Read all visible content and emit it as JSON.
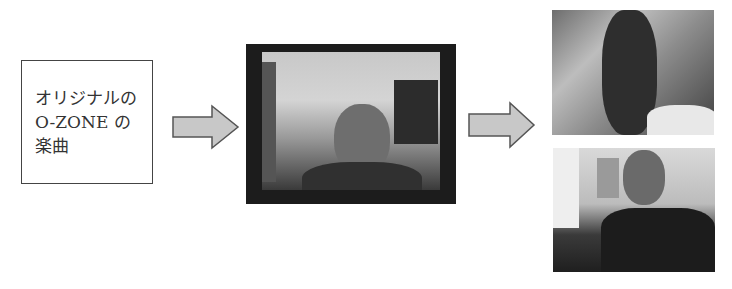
{
  "diagram": {
    "source_box": {
      "lines": [
        "オリジナルの",
        "O-ZONE の",
        "楽曲"
      ]
    },
    "arrows": [
      {
        "from": "source_box",
        "to": "center_image",
        "fill": "#c8c8c8"
      },
      {
        "from": "center_image",
        "to": "output_images",
        "fill": "#c8c8c8"
      }
    ],
    "center_image": {
      "description": "webcam video frame of a man with glasses lip-syncing",
      "frame_color": "#1c1c1c"
    },
    "output_images": [
      {
        "description": "blurry webcam frame of a person in white shirt"
      },
      {
        "description": "webcam frame of a young man singing in a room"
      }
    ]
  }
}
